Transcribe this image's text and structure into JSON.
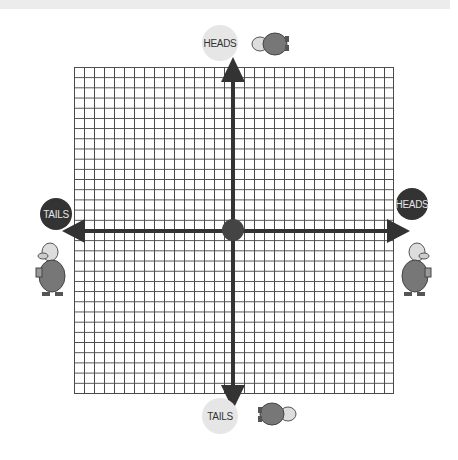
{
  "diagram": {
    "type": "coordinate-plane",
    "grid": {
      "columns": 32,
      "rows": 32,
      "line_color": "#4a4a4a"
    },
    "axes": {
      "color": "#333333",
      "origin_marker_color": "#444444"
    },
    "labels": {
      "top": "HEADS",
      "bottom": "TAILS",
      "left": "TAILS",
      "right": "HEADS"
    },
    "label_styles": {
      "top": "light",
      "bottom": "light",
      "left": "dark",
      "right": "dark"
    },
    "figures": [
      {
        "position": "top",
        "description": "cartoon man holding coin, rotated sideways",
        "icon": "cartoon-man-icon"
      },
      {
        "position": "bottom",
        "description": "cartoon man holding coin, upside-down rotated",
        "icon": "cartoon-man-icon"
      },
      {
        "position": "left",
        "description": "cartoon man holding coin",
        "icon": "cartoon-man-icon"
      },
      {
        "position": "right",
        "description": "cartoon man holding coin, mirrored",
        "icon": "cartoon-man-icon"
      }
    ]
  }
}
